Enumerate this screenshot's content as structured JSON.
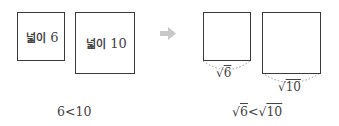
{
  "left": {
    "small_square": {
      "label_word": "넓이",
      "label_value": "6"
    },
    "large_square": {
      "label_word": "넓이",
      "label_value": "10"
    },
    "comparison": "6<10"
  },
  "arrow": {
    "icon": "right-arrow-icon",
    "color": "#c8c8c8"
  },
  "right": {
    "small_square": {
      "side_label": "6"
    },
    "large_square": {
      "side_label": "10"
    },
    "comparison": {
      "lhs": "6",
      "op": "<",
      "rhs": "10"
    }
  },
  "colors": {
    "stroke": "#3a3a3a",
    "text": "#444444",
    "dotted": "#9a9a9a"
  }
}
